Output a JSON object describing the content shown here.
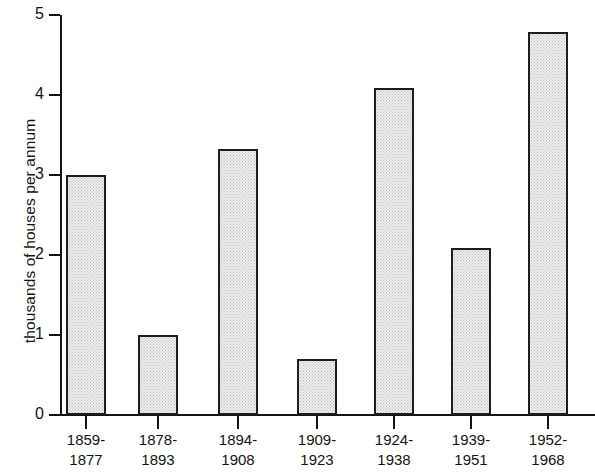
{
  "chart_data": {
    "type": "bar",
    "title": "",
    "xlabel": "",
    "ylabel": "thousands of houses per annum",
    "categories": [
      "1859-\n1877",
      "1878-\n1893",
      "1894-\n1908",
      "1909-\n1923",
      "1924-\n1938",
      "1939-\n1951",
      "1952-\n1968"
    ],
    "category_lines": [
      [
        "1859-",
        "1877"
      ],
      [
        "1878-",
        "1893"
      ],
      [
        "1894-",
        "1908"
      ],
      [
        "1909-",
        "1923"
      ],
      [
        "1924-",
        "1938"
      ],
      [
        "1939-",
        "1951"
      ],
      [
        "1952-",
        "1968"
      ]
    ],
    "values": [
      3.0,
      1.0,
      3.33,
      0.7,
      4.09,
      2.09,
      4.79
    ],
    "ylim": [
      0,
      5
    ],
    "yticks": [
      0,
      1,
      2,
      3,
      4,
      5
    ],
    "ytick_labels": [
      "0",
      "1",
      "2",
      "3",
      "4",
      "5"
    ],
    "grid": false,
    "legend": false,
    "bar_fill_color": "#eeeeee",
    "bar_edge_color": "#1d1d1d",
    "axis_color": "#141414"
  }
}
